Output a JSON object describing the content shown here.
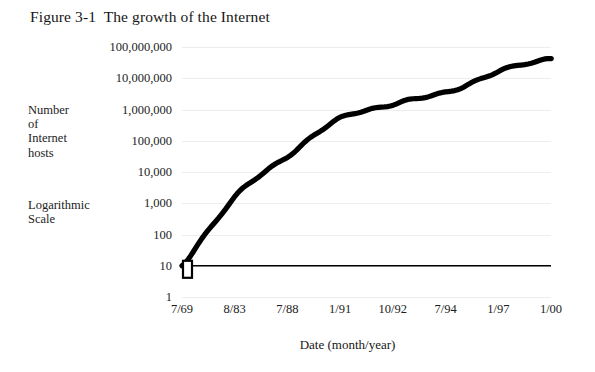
{
  "figure": {
    "title": "Figure 3-1  The growth of the Internet",
    "side_label_hosts": "Number\nof\nInternet\nhosts",
    "side_label_scale": "Logarithmic\nScale",
    "ink_color": "#000000",
    "grid_color": "#ededed",
    "background": "#ffffff"
  },
  "chart_data": {
    "type": "line",
    "title": "Figure 3-1  The growth of the Internet",
    "subtitle": "",
    "xlabel": "Date (month/year)",
    "ylabel": "Number of Internet hosts",
    "yscale": "log",
    "ylim": [
      1,
      100000000
    ],
    "grid": true,
    "legend": false,
    "annotations": [
      "Logarithmic Scale",
      "Number of Internet hosts"
    ],
    "ytick_labels": [
      "100,000,000",
      "10,000,000",
      "1,000,000",
      "100,000",
      "10,000",
      "1,000",
      "100",
      "10",
      "1"
    ],
    "ytick_values": [
      100000000,
      10000000,
      1000000,
      100000,
      10000,
      1000,
      100,
      10,
      1
    ],
    "xtick_labels": [
      "7/69",
      "8/83",
      "7/88",
      "1/91",
      "10/92",
      "7/94",
      "1/97",
      "1/00"
    ],
    "categories": [
      "7/69",
      "8/83",
      "7/88",
      "1/91",
      "10/92",
      "7/94",
      "1/97",
      "1/00"
    ],
    "values": [
      10,
      1500,
      33000,
      500000,
      1500000,
      3500000,
      16000000,
      45000000
    ],
    "series": [
      {
        "name": "Internet hosts",
        "x": [
          "7/69",
          "8/83",
          "7/88",
          "1/91",
          "10/92",
          "7/94",
          "1/97",
          "1/00"
        ],
        "values": [
          10,
          1500,
          33000,
          500000,
          1500000,
          3500000,
          16000000,
          45000000
        ]
      }
    ],
    "reference_line": {
      "orientation": "horizontal",
      "value": 10,
      "label": ""
    },
    "start_marker": {
      "shape": "rectangle",
      "at_x": "7/69",
      "at_y": 10
    }
  },
  "xaxis": {
    "title": "Date (month/year)"
  }
}
